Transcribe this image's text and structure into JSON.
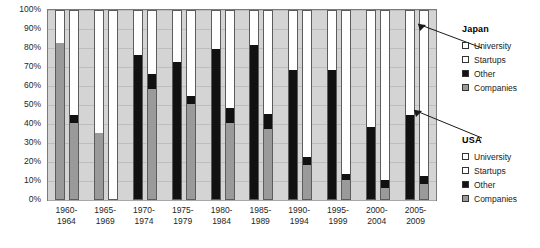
{
  "chart_data": {
    "type": "bar",
    "title": "",
    "xlabel": "",
    "ylabel": "",
    "ylim": [
      0,
      100
    ],
    "grid": true,
    "stacked": true,
    "stack_order_bottom_to_top": [
      "Companies",
      "Other",
      "Startups",
      "University"
    ],
    "categories": [
      "1960-1964",
      "1965-1969",
      "1970-1974",
      "1975-1979",
      "1980-1984",
      "1985-1989",
      "1990-1994",
      "1995-1999",
      "2000-2004",
      "2005-2009"
    ],
    "category_lines": [
      [
        "1960-",
        "1964"
      ],
      [
        "1965-",
        "1969"
      ],
      [
        "1970-",
        "1974"
      ],
      [
        "1975-",
        "1979"
      ],
      [
        "1980-",
        "1984"
      ],
      [
        "1985-",
        "1989"
      ],
      [
        "1990-",
        "1994"
      ],
      [
        "1995-",
        "1999"
      ],
      [
        "2000-",
        "2004"
      ],
      [
        "2005-",
        "2009"
      ]
    ],
    "y_ticks": [
      "0%",
      "10%",
      "20%",
      "30%",
      "40%",
      "50%",
      "60%",
      "70%",
      "80%",
      "90%",
      "100%"
    ],
    "groups": [
      {
        "country": "Japan",
        "series": [
          {
            "name": "Companies",
            "values": [
              82,
              35,
              0,
              0,
              0,
              0,
              0,
              0,
              0,
              0
            ]
          },
          {
            "name": "Other",
            "values": [
              0,
              0,
              76,
              72,
              79,
              81,
              68,
              68,
              38,
              44
            ]
          },
          {
            "name": "Startups",
            "values": [
              0,
              0,
              0,
              0,
              0,
              0,
              0,
              0,
              0,
              0
            ]
          },
          {
            "name": "University",
            "values": [
              18,
              65,
              24,
              28,
              21,
              19,
              32,
              32,
              62,
              56
            ]
          }
        ]
      },
      {
        "country": "USA",
        "series": [
          {
            "name": "Companies",
            "values": [
              40,
              0,
              58,
              50,
              40,
              37,
              18,
              10,
              6,
              8
            ]
          },
          {
            "name": "Other",
            "values": [
              4,
              0,
              8,
              4,
              8,
              8,
              4,
              3,
              4,
              4
            ]
          },
          {
            "name": "Startups",
            "values": [
              0,
              0,
              0,
              0,
              0,
              0,
              0,
              0,
              0,
              0
            ]
          },
          {
            "name": "University",
            "values": [
              56,
              100,
              34,
              46,
              52,
              55,
              78,
              87,
              90,
              88
            ]
          }
        ]
      }
    ],
    "colors": {
      "university": "#ffffff",
      "startups": "#ffffff",
      "other": "#111111",
      "companies": "#9a9a9a",
      "plot_background": "#d4d4d4",
      "gridline": "#bdbdbd",
      "axis": "#7a7a7a"
    }
  },
  "legends": [
    {
      "id": "japan",
      "title": "Japan",
      "items": [
        {
          "label": "University",
          "swatch": "university"
        },
        {
          "label": "Startups",
          "swatch": "startups"
        },
        {
          "label": "Other",
          "swatch": "other"
        },
        {
          "label": "Companies",
          "swatch": "companies"
        }
      ]
    },
    {
      "id": "usa",
      "title": "USA",
      "items": [
        {
          "label": "University",
          "swatch": "university"
        },
        {
          "label": "Startups",
          "swatch": "startups"
        },
        {
          "label": "Other",
          "swatch": "other"
        },
        {
          "label": "Companies",
          "swatch": "companies"
        }
      ]
    }
  ]
}
